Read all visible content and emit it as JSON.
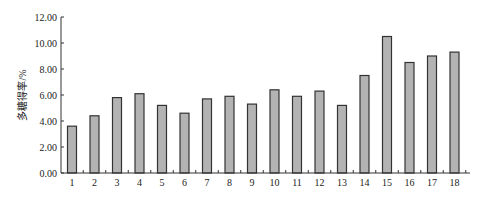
{
  "chart_data": {
    "type": "bar",
    "title": "",
    "xlabel": "",
    "ylabel": "多糖得率/%",
    "ylim": [
      0,
      12
    ],
    "yticks": [
      "0.00",
      "2.00",
      "4.00",
      "6.00",
      "8.00",
      "10.00",
      "12.00"
    ],
    "grid": false,
    "legend": null,
    "categories": [
      "1",
      "2",
      "3",
      "4",
      "5",
      "6",
      "7",
      "8",
      "9",
      "10",
      "11",
      "12",
      "13",
      "14",
      "15",
      "16",
      "17",
      "18"
    ],
    "values": [
      3.6,
      4.4,
      5.8,
      6.1,
      5.2,
      4.6,
      5.7,
      5.9,
      5.3,
      6.4,
      5.9,
      6.3,
      5.2,
      7.5,
      10.5,
      8.5,
      9.0,
      9.3
    ],
    "colors": {
      "bar_fill": "#b3b3b3",
      "bar_stroke": "#333333",
      "axis": "#333333"
    }
  }
}
